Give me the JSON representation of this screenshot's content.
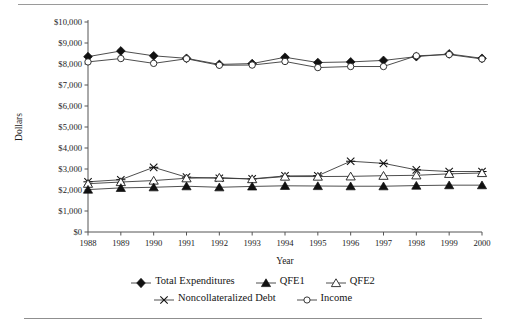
{
  "figure": {
    "y_axis_title": "Dollars",
    "x_axis_title": "Year"
  },
  "legend": {
    "rows": [
      [
        {
          "label": "Total Expenditures",
          "marker": "filled-diamond-icon"
        },
        {
          "label": "QFE1",
          "marker": "filled-triangle-icon"
        },
        {
          "label": "QFE2",
          "marker": "open-triangle-icon"
        }
      ],
      [
        {
          "label": "Noncollateralized Debt",
          "marker": "cross-star-icon"
        },
        {
          "label": "Income",
          "marker": "open-circle-icon"
        }
      ]
    ]
  },
  "chart_data": {
    "type": "line",
    "title": "",
    "xlabel": "Year",
    "ylabel": "Dollars",
    "categories": [
      "1988",
      "1989",
      "1990",
      "1991",
      "1992",
      "1993",
      "1994",
      "1995",
      "1996",
      "1997",
      "1998",
      "1999",
      "2000"
    ],
    "x": [
      1988,
      1989,
      1990,
      1991,
      1992,
      1993,
      1994,
      1995,
      1996,
      1997,
      1998,
      1999,
      2000
    ],
    "ylim": [
      0,
      10000
    ],
    "ytick_labels": [
      "$10,000",
      "$9,000",
      "$8,000",
      "$7,000",
      "$6,000",
      "$5,000",
      "$4,000",
      "$3,000",
      "$2,000",
      "$1,000",
      "$0"
    ],
    "yticks": [
      10000,
      9000,
      8000,
      7000,
      6000,
      5000,
      4000,
      3000,
      2000,
      1000,
      0
    ],
    "grid": false,
    "legend_position": "bottom",
    "series": [
      {
        "name": "Total Expenditures",
        "marker": "filled-diamond",
        "values": [
          8350,
          8620,
          8390,
          8270,
          7980,
          8020,
          8320,
          8070,
          8100,
          8170,
          8350,
          8480,
          8270
        ]
      },
      {
        "name": "Income",
        "marker": "open-circle",
        "values": [
          8100,
          8260,
          8030,
          8250,
          7940,
          7950,
          8120,
          7830,
          7880,
          7880,
          8390,
          8450,
          8240
        ]
      },
      {
        "name": "Noncollateralized Debt",
        "marker": "cross-star",
        "values": [
          2390,
          2490,
          3080,
          2610,
          2560,
          2530,
          2670,
          2680,
          3370,
          3270,
          2960,
          2880,
          2880
        ]
      },
      {
        "name": "QFE2",
        "marker": "open-triangle",
        "values": [
          2300,
          2380,
          2450,
          2560,
          2590,
          2520,
          2640,
          2640,
          2650,
          2680,
          2700,
          2770,
          2810
        ]
      },
      {
        "name": "QFE1",
        "marker": "filled-triangle",
        "values": [
          2020,
          2100,
          2130,
          2180,
          2130,
          2170,
          2200,
          2190,
          2180,
          2180,
          2210,
          2230,
          2230
        ]
      }
    ]
  }
}
